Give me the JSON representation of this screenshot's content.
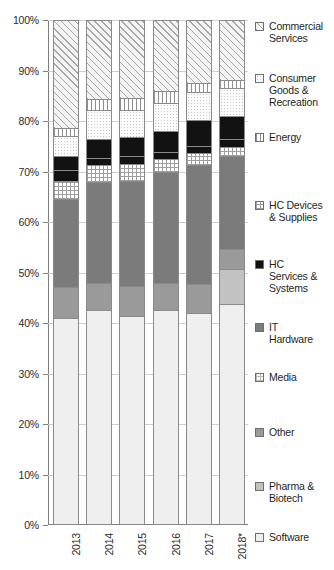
{
  "chart_data": {
    "type": "bar",
    "subtype": "stacked-100-percent",
    "title": "",
    "xlabel": "",
    "ylabel": "",
    "ylim": [
      0,
      100
    ],
    "y_unit": "%",
    "grid": true,
    "legend_position": "right",
    "categories": [
      "2013",
      "2014",
      "2015",
      "2016",
      "2017",
      "2018*"
    ],
    "y_ticks": [
      "0%",
      "10%",
      "20%",
      "30%",
      "40%",
      "50%",
      "60%",
      "70%",
      "80%",
      "90%",
      "100%"
    ],
    "y_tick_values": [
      0,
      10,
      20,
      30,
      40,
      50,
      60,
      70,
      80,
      90,
      100
    ],
    "series": [
      {
        "name": "Software",
        "key": "software",
        "pattern": "solid-lightest",
        "color": "#efefef",
        "values": [
          41.0,
          42.6,
          41.4,
          42.5,
          41.9,
          43.8
        ]
      },
      {
        "name": "Pharma & Biotech",
        "key": "pharma",
        "pattern": "solid-light",
        "color": "#c2c2c2",
        "values": [
          0.0,
          0.0,
          0.0,
          0.0,
          0.0,
          6.8
        ]
      },
      {
        "name": "Other",
        "key": "other",
        "pattern": "solid-medium",
        "color": "#9a9a9a",
        "values": [
          6.2,
          5.4,
          6.0,
          5.5,
          5.9,
          4.0
        ]
      },
      {
        "name": "Media",
        "key": "media",
        "pattern": "fine-grid",
        "color": "#ffffff",
        "values": [
          0.0,
          0.0,
          0.0,
          0.0,
          0.0,
          0.0
        ]
      },
      {
        "name": "IT Hardware",
        "key": "ithardware",
        "pattern": "solid-dark",
        "color": "#7b7b7b",
        "values": [
          17.3,
          20.0,
          20.8,
          22.0,
          23.5,
          18.4
        ]
      },
      {
        "name": "HC Devices & Supplies",
        "key": "hcdevices",
        "pattern": "grid",
        "color": "#ffffff",
        "values": [
          3.7,
          3.2,
          3.2,
          2.4,
          2.4,
          1.9
        ]
      },
      {
        "name": "HC Services & Systems",
        "key": "hcservices",
        "pattern": "solid-black",
        "color": "#121212",
        "values": [
          2.1,
          1.5,
          1.6,
          1.4,
          1.4,
          1.5
        ]
      },
      {
        "name": "HC Services & Systems (black)",
        "key": "hcservices2",
        "pattern": "solid-black",
        "color": "#121212",
        "values": [
          2.7,
          3.8,
          3.9,
          4.3,
          5.2,
          4.5
        ]
      },
      {
        "name": "Consumer Goods & Recreation",
        "key": "consumer",
        "pattern": "dotted",
        "color": "#fbfbfb",
        "values": [
          4.1,
          5.6,
          5.2,
          5.4,
          5.5,
          5.6
        ]
      },
      {
        "name": "Energy",
        "key": "energy",
        "pattern": "vertical-lines",
        "color": "#ffffff",
        "values": [
          1.6,
          2.2,
          2.4,
          2.4,
          1.7,
          1.7
        ]
      },
      {
        "name": "Commercial Services",
        "key": "commercial",
        "pattern": "diagonal-hatch",
        "color": "#f4f4f4",
        "values": [
          21.3,
          15.7,
          15.5,
          14.1,
          12.5,
          11.8
        ]
      }
    ],
    "legend_entries": [
      {
        "label": "Commercial\nServices",
        "key": "commercial",
        "top": 6
      },
      {
        "label": "Consumer\nGoods &\nRecreation",
        "key": "consumer",
        "top": 58
      },
      {
        "label": "Energy",
        "key": "energy",
        "top": 117
      },
      {
        "label": "HC Devices\n& Supplies",
        "key": "hcdevices",
        "top": 185
      },
      {
        "label": "HC\nServices &\nSystems",
        "key": "hcservices",
        "top": 244
      },
      {
        "label": "IT\nHardware",
        "key": "ithardware",
        "top": 307
      },
      {
        "label": "Media",
        "key": "media",
        "top": 357
      },
      {
        "label": "Other",
        "key": "other",
        "top": 412
      },
      {
        "label": "Pharma &\nBiotech",
        "key": "pharma",
        "top": 466
      },
      {
        "label": "Software",
        "key": "software",
        "top": 517
      }
    ]
  }
}
